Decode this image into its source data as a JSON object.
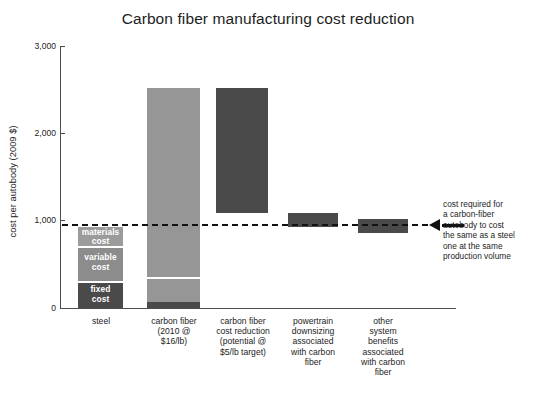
{
  "chart_data": {
    "type": "bar",
    "title": "Carbon fiber manufacturing cost reduction",
    "xlabel": "",
    "ylabel": "cost per autobody (2009 $)",
    "ylim": [
      0,
      3000
    ],
    "ytick_labels": [
      "3,000",
      "2,000",
      "1,000",
      "0"
    ],
    "ytick_values": [
      3000,
      2000,
      1000,
      0
    ],
    "grid": false,
    "legend_position": "in-bar-labels",
    "categories": [
      "steel",
      "carbon fiber (2010 @ $16/lb)",
      "carbon fiber cost reduction (potential @ $5/lb target)",
      "powertrain downsizing associated with carbon fiber",
      "other system benefits associated with carbon fiber"
    ],
    "category_label_lines": [
      [
        "steel"
      ],
      [
        "carbon fiber",
        "(2010 @",
        "$16/lb)"
      ],
      [
        "carbon fiber",
        "cost reduction",
        "(potential @",
        "$5/lb target)"
      ],
      [
        "powertrain",
        "downsizing",
        "associated",
        "with carbon",
        "fiber"
      ],
      [
        "other",
        "system",
        "benefits",
        "associated",
        "with carbon",
        "fiber"
      ]
    ],
    "bars": [
      {
        "name": "steel",
        "kind": "stacked",
        "base": 0,
        "top": 930,
        "segments": [
          {
            "label": "fixed cost",
            "from": 0,
            "to": 310,
            "color": "#4a4a4a"
          },
          {
            "label": "variable cost",
            "from": 310,
            "to": 710,
            "color": "#8c8c8c"
          },
          {
            "label": "materials cost",
            "from": 710,
            "to": 930,
            "color": "#9b9b9b"
          }
        ]
      },
      {
        "name": "carbon fiber (2010 @ $16/lb)",
        "kind": "stacked",
        "base": 0,
        "top": 2520,
        "segments": [
          {
            "label": "",
            "from": 0,
            "to": 70,
            "color": "#4a4a4a"
          },
          {
            "label": "",
            "from": 70,
            "to": 355,
            "color": "#969696"
          },
          {
            "label": "",
            "from": 355,
            "to": 2520,
            "color": "#969696"
          }
        ]
      },
      {
        "name": "carbon fiber cost reduction (potential @ $5/lb target)",
        "kind": "floating",
        "base": 1090,
        "top": 2520,
        "color": "#4a4a4a"
      },
      {
        "name": "powertrain downsizing associated with carbon fiber",
        "kind": "floating",
        "base": 930,
        "top": 1090,
        "color": "#4a4a4a"
      },
      {
        "name": "other system benefits associated with carbon fiber",
        "kind": "floating",
        "base": 860,
        "top": 1010,
        "color": "#4a4a4a"
      }
    ],
    "reference_line": {
      "value": 950,
      "style": "dashed",
      "color": "#111111",
      "annotation": "cost required for a carbon-fiber autobody to cost the same as a steel one at the same production volume"
    },
    "colors": {
      "bar_dark": "#4a4a4a",
      "bar_mid": "#969696",
      "bar_light": "#9b9b9b",
      "axis": "#4d4d4d",
      "text": "#1d1d1d",
      "reference": "#111111"
    }
  },
  "annotation_lines": [
    "cost required for",
    "a carbon-fiber",
    "autobody to cost",
    "the same as a steel",
    "one at the same",
    "production volume"
  ],
  "segment_labels": {
    "materials": "materials cost",
    "variable": "variable cost",
    "fixed": "fixed cost"
  }
}
